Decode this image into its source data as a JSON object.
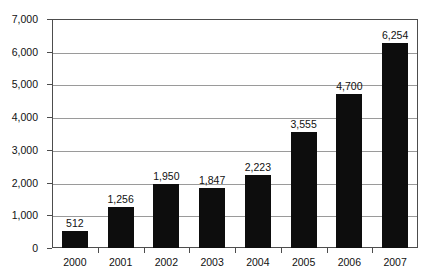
{
  "chart_data": {
    "type": "bar",
    "title": "",
    "subtitle": "",
    "xlabel": "",
    "ylabel": "",
    "categories": [
      "2000",
      "2001",
      "2002",
      "2003",
      "2004",
      "2005",
      "2006",
      "2007"
    ],
    "values": [
      512,
      1256,
      1950,
      1847,
      2223,
      3555,
      4700,
      6254
    ],
    "data_labels": [
      "512",
      "1,256",
      "1,950",
      "1,847",
      "2,223",
      "3,555",
      "4,700",
      "6,254"
    ],
    "series": [
      {
        "name": "",
        "values": [
          512,
          1256,
          1950,
          1847,
          2223,
          3555,
          4700,
          6254
        ]
      }
    ],
    "ylim": [
      0,
      7000
    ],
    "ytick_values": [
      0,
      1000,
      2000,
      3000,
      4000,
      5000,
      6000,
      7000
    ],
    "ytick_labels": [
      "0",
      "1,000",
      "2,000",
      "3,000",
      "4,000",
      "5,000",
      "6,000",
      "7,000"
    ],
    "grid": true,
    "grid_axis": "y",
    "legend": false,
    "legend_position": "none",
    "bar_color": "#0d0d0d",
    "grid_color": "#9a9a9a",
    "axis_color": "#4d4d4d",
    "background_color": "#ffffff",
    "text_color": "#111111"
  }
}
